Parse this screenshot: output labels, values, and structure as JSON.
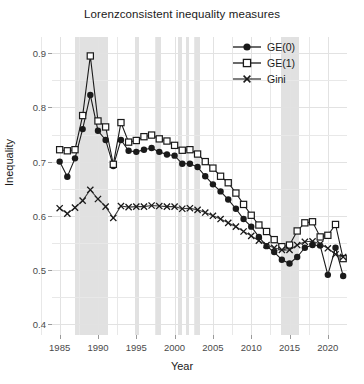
{
  "chart_data": {
    "type": "line",
    "title": "Lorenzconsistent inequality measures",
    "xlabel": "Year",
    "ylabel": "Inequality",
    "xlim": [
      1984.0,
      2022.5
    ],
    "ylim": [
      0.38,
      0.93
    ],
    "xticks": [
      1985,
      1990,
      1995,
      2000,
      2005,
      2010,
      2015,
      2020
    ],
    "yticks": [
      0.4,
      0.5,
      0.6,
      0.7,
      0.8,
      0.9
    ],
    "ytick_labels": [
      "0.4",
      "0.5",
      "0.6",
      "0.7",
      "0.8",
      "0.9"
    ],
    "xtick_labels": [
      "1985",
      "1990",
      "1995",
      "2000",
      "2005",
      "2010",
      "2015",
      "2020"
    ],
    "grid": true,
    "legend_position": "top-right",
    "x": [
      1985,
      1986,
      1987,
      1988,
      1989,
      1990,
      1991,
      1992,
      1993,
      1994,
      1995,
      1996,
      1997,
      1998,
      1999,
      2000,
      2001,
      2002,
      2003,
      2004,
      2005,
      2006,
      2007,
      2008,
      2009,
      2010,
      2011,
      2012,
      2013,
      2014,
      2015,
      2016,
      2017,
      2018,
      2019,
      2020,
      2021,
      2022
    ],
    "series": [
      {
        "name": "GE(0)",
        "marker": "filled-circle",
        "color": "#1a1a1a",
        "values": [
          0.7,
          0.672,
          0.706,
          0.76,
          0.823,
          0.757,
          0.74,
          0.692,
          0.74,
          0.72,
          0.718,
          0.722,
          0.725,
          0.718,
          0.713,
          0.711,
          0.696,
          0.696,
          0.69,
          0.673,
          0.658,
          0.645,
          0.63,
          0.613,
          0.594,
          0.58,
          0.561,
          0.544,
          0.533,
          0.519,
          0.512,
          0.524,
          0.541,
          0.546,
          0.545,
          0.491,
          0.541,
          0.489
        ]
      },
      {
        "name": "GE(1)",
        "marker": "open-square",
        "color": "#1a1a1a",
        "values": [
          0.722,
          0.72,
          0.722,
          0.785,
          0.895,
          0.775,
          0.764,
          0.695,
          0.772,
          0.736,
          0.739,
          0.746,
          0.749,
          0.742,
          0.738,
          0.73,
          0.721,
          0.722,
          0.714,
          0.7,
          0.688,
          0.673,
          0.661,
          0.642,
          0.621,
          0.601,
          0.583,
          0.571,
          0.556,
          0.543,
          0.546,
          0.572,
          0.587,
          0.589,
          0.561,
          0.564,
          0.584,
          0.521
        ]
      },
      {
        "name": "Gini",
        "marker": "x",
        "color": "#3a3a3a",
        "values": [
          0.614,
          0.604,
          0.615,
          0.628,
          0.648,
          0.631,
          0.617,
          0.596,
          0.618,
          0.616,
          0.617,
          0.617,
          0.619,
          0.618,
          0.617,
          0.617,
          0.613,
          0.614,
          0.611,
          0.606,
          0.6,
          0.594,
          0.587,
          0.58,
          0.571,
          0.563,
          0.554,
          0.546,
          0.541,
          0.537,
          0.537,
          0.546,
          0.552,
          0.553,
          0.548,
          0.54,
          0.529,
          0.524
        ]
      }
    ],
    "shaded_bands": [
      {
        "start": 1987.0,
        "end": 1991.3
      },
      {
        "start": 1994.8,
        "end": 1995.4
      },
      {
        "start": 1997.6,
        "end": 1998.2
      },
      {
        "start": 2000.4,
        "end": 2001.0
      },
      {
        "start": 2001.5,
        "end": 2001.9
      },
      {
        "start": 2002.6,
        "end": 2003.3
      },
      {
        "start": 2013.9,
        "end": 2016.2
      }
    ]
  },
  "legend": {
    "items": [
      {
        "label": "GE(0)"
      },
      {
        "label": "GE(1)"
      },
      {
        "label": "Gini"
      }
    ]
  }
}
